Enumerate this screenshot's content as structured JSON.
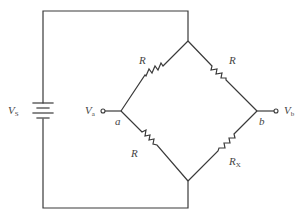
{
  "diagram": {
    "type": "wheatstone-bridge-circuit",
    "source": {
      "label": "V",
      "subscript": "S",
      "symbol": "battery"
    },
    "nodes": {
      "a": {
        "label": "a",
        "terminal_label": "V",
        "terminal_subscript": "a"
      },
      "b": {
        "label": "b",
        "terminal_label": "V",
        "terminal_subscript": "b"
      }
    },
    "resistors": [
      {
        "id": "top-left",
        "label": "R",
        "subscript": ""
      },
      {
        "id": "top-right",
        "label": "R",
        "subscript": ""
      },
      {
        "id": "bottom-left",
        "label": "R",
        "subscript": ""
      },
      {
        "id": "bottom-right",
        "label": "R",
        "subscript": "X"
      }
    ],
    "colors": {
      "line": "#3a3a3a",
      "text": "#444444",
      "background": "#ffffff"
    }
  }
}
